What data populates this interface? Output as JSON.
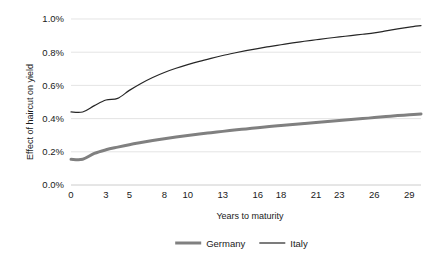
{
  "chart_data": {
    "type": "line",
    "title": "",
    "xlabel": "Years to maturity",
    "ylabel": "Effect of haircut on yield",
    "xlim": [
      0,
      30
    ],
    "ylim": [
      0,
      0.01
    ],
    "grid": true,
    "legend_position": "bottom",
    "ytick_labels": [
      "0.0%",
      "0.2%",
      "0.4%",
      "0.6%",
      "0.8%",
      "1.0%"
    ],
    "ytick_values": [
      0.0,
      0.002,
      0.004,
      0.006,
      0.008,
      0.01
    ],
    "xtick_labels": [
      "0",
      "3",
      "5",
      "8",
      "10",
      "13",
      "16",
      "18",
      "21",
      "23",
      "26",
      "29"
    ],
    "xtick_values": [
      0,
      3,
      5,
      8,
      10,
      13,
      16,
      18,
      21,
      23,
      26,
      29
    ],
    "x": [
      0,
      1,
      2,
      3,
      4,
      5,
      6,
      7,
      8,
      9,
      10,
      11,
      12,
      13,
      14,
      15,
      16,
      17,
      18,
      19,
      20,
      21,
      22,
      23,
      24,
      25,
      26,
      27,
      28,
      29,
      30
    ],
    "series": [
      {
        "name": "Germany",
        "color": "#808080",
        "line_width": 3.0,
        "values": [
          0.00155,
          0.00155,
          0.0019,
          0.00212,
          0.00228,
          0.00243,
          0.00256,
          0.00268,
          0.00279,
          0.00289,
          0.00298,
          0.00307,
          0.00315,
          0.00323,
          0.00331,
          0.00338,
          0.00345,
          0.00352,
          0.00358,
          0.00364,
          0.0037,
          0.00376,
          0.00382,
          0.00388,
          0.00394,
          0.004,
          0.00406,
          0.00412,
          0.00418,
          0.00423,
          0.00428
        ]
      },
      {
        "name": "Italy",
        "color": "#262626",
        "line_width": 1.2,
        "values": [
          0.0044,
          0.0044,
          0.00478,
          0.00512,
          0.00522,
          0.0057,
          0.00612,
          0.00648,
          0.00678,
          0.00703,
          0.00725,
          0.00745,
          0.00763,
          0.0078,
          0.00795,
          0.00809,
          0.00822,
          0.00834,
          0.00845,
          0.00856,
          0.00866,
          0.00875,
          0.00884,
          0.00892,
          0.009,
          0.00908,
          0.00916,
          0.00928,
          0.0094,
          0.00951,
          0.0096
        ]
      }
    ]
  },
  "legend": {
    "items": [
      {
        "label": "Germany"
      },
      {
        "label": "Italy"
      }
    ]
  }
}
